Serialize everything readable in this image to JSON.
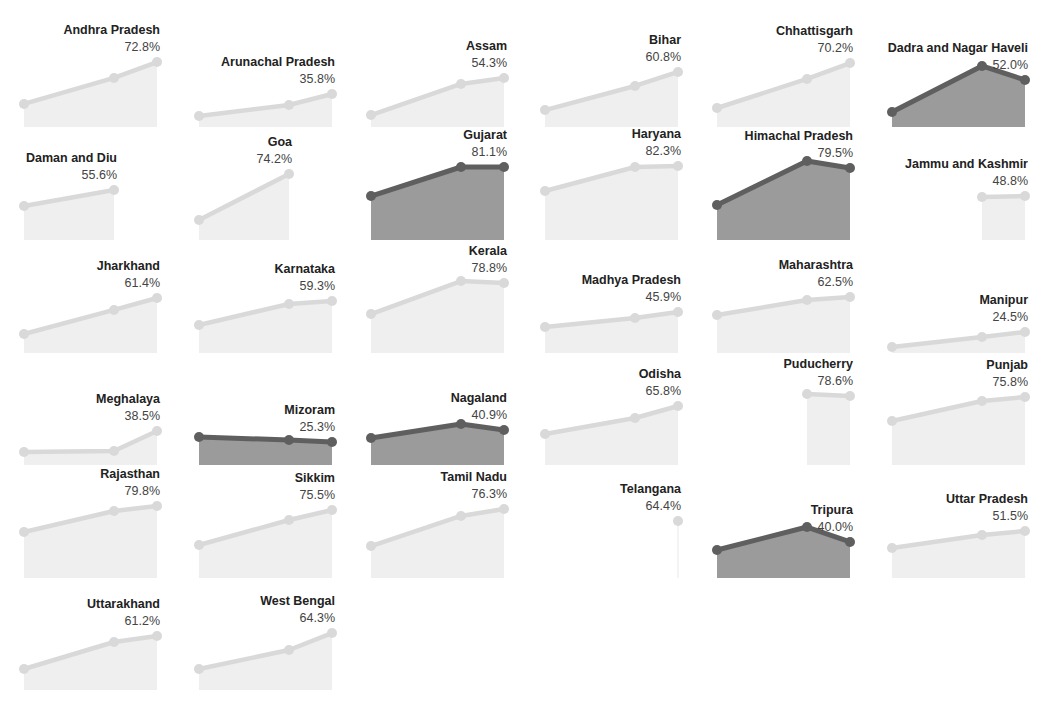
{
  "chart_data": {
    "type": "area",
    "title": "",
    "xlabel": "",
    "ylabel": "",
    "ylim": [
      0,
      100
    ],
    "grid": false,
    "legend": null,
    "layout": "small-multiples 6 columns",
    "x_slots": 3,
    "colors": {
      "muted_line": "#d9d9d9",
      "muted_fill": "#efefef",
      "highlight_line": "#5f5f5f",
      "highlight_fill": "#9b9b9b"
    },
    "panels": [
      {
        "name": "Andhra Pradesh",
        "label": "72.8%",
        "highlight": false,
        "points": [
          [
            0,
            20.4
          ],
          [
            1,
            43.4
          ],
          [
            2,
            57.5
          ]
        ]
      },
      {
        "name": "Arunachal Pradesh",
        "label": "35.8%",
        "highlight": false,
        "points": [
          [
            0,
            9.7
          ],
          [
            1,
            19.5
          ],
          [
            2,
            29.2
          ]
        ]
      },
      {
        "name": "Assam",
        "label": "54.3%",
        "highlight": false,
        "points": [
          [
            0,
            10.6
          ],
          [
            1,
            38.1
          ],
          [
            2,
            43.4
          ]
        ]
      },
      {
        "name": "Bihar",
        "label": "60.8%",
        "highlight": false,
        "points": [
          [
            0,
            15.0
          ],
          [
            1,
            36.3
          ],
          [
            2,
            48.7
          ]
        ]
      },
      {
        "name": "Chhattisgarh",
        "label": "70.2%",
        "highlight": false,
        "points": [
          [
            0,
            16.8
          ],
          [
            1,
            42.5
          ],
          [
            2,
            56.6
          ]
        ]
      },
      {
        "name": "Dadra and Nagar Haveli",
        "label": "52.0%",
        "highlight": true,
        "points": [
          [
            0,
            13.3
          ],
          [
            1,
            54.0
          ],
          [
            2,
            41.6
          ]
        ]
      },
      {
        "name": "Daman and Diu",
        "label": "55.6%",
        "highlight": false,
        "points": [
          [
            0,
            30.1
          ],
          [
            1,
            44.2
          ]
        ]
      },
      {
        "name": "Goa",
        "label": "74.2%",
        "highlight": false,
        "points": [
          [
            0,
            17.7
          ],
          [
            1,
            58.4
          ]
        ]
      },
      {
        "name": "Gujarat",
        "label": "81.1%",
        "highlight": true,
        "points": [
          [
            0,
            38.9
          ],
          [
            1,
            64.6
          ],
          [
            2,
            64.6
          ]
        ]
      },
      {
        "name": "Haryana",
        "label": "82.3%",
        "highlight": false,
        "points": [
          [
            0,
            43.4
          ],
          [
            1,
            64.6
          ],
          [
            2,
            65.5
          ]
        ]
      },
      {
        "name": "Himachal Pradesh",
        "label": "79.5%",
        "highlight": true,
        "points": [
          [
            0,
            31.0
          ],
          [
            1,
            69.9
          ],
          [
            2,
            63.7
          ]
        ]
      },
      {
        "name": "Jammu and Kashmir",
        "label": "48.8%",
        "highlight": false,
        "points": [
          [
            1,
            38.1
          ],
          [
            2,
            38.9
          ]
        ]
      },
      {
        "name": "Jharkhand",
        "label": "61.4%",
        "highlight": false,
        "points": [
          [
            0,
            16.8
          ],
          [
            1,
            38.1
          ],
          [
            2,
            48.7
          ]
        ]
      },
      {
        "name": "Karnataka",
        "label": "59.3%",
        "highlight": false,
        "points": [
          [
            0,
            24.8
          ],
          [
            1,
            43.4
          ],
          [
            2,
            46.0
          ]
        ]
      },
      {
        "name": "Kerala",
        "label": "78.8%",
        "highlight": false,
        "points": [
          [
            0,
            34.5
          ],
          [
            1,
            63.7
          ],
          [
            2,
            61.9
          ]
        ]
      },
      {
        "name": "Madhya Pradesh",
        "label": "45.9%",
        "highlight": false,
        "points": [
          [
            0,
            23.0
          ],
          [
            1,
            31.0
          ],
          [
            2,
            36.3
          ]
        ]
      },
      {
        "name": "Maharashtra",
        "label": "62.5%",
        "highlight": false,
        "points": [
          [
            0,
            33.6
          ],
          [
            1,
            46.9
          ],
          [
            2,
            49.6
          ]
        ]
      },
      {
        "name": "Manipur",
        "label": "24.5%",
        "highlight": false,
        "points": [
          [
            0,
            5.3
          ],
          [
            1,
            14.2
          ],
          [
            2,
            18.6
          ]
        ]
      },
      {
        "name": "Meghalaya",
        "label": "38.5%",
        "highlight": false,
        "points": [
          [
            0,
            11.5
          ],
          [
            1,
            12.4
          ],
          [
            2,
            30.1
          ]
        ]
      },
      {
        "name": "Mizoram",
        "label": "25.3%",
        "highlight": true,
        "points": [
          [
            0,
            24.8
          ],
          [
            1,
            22.1
          ],
          [
            2,
            20.4
          ]
        ]
      },
      {
        "name": "Nagaland",
        "label": "40.9%",
        "highlight": true,
        "points": [
          [
            0,
            23.9
          ],
          [
            1,
            36.3
          ],
          [
            2,
            31.0
          ]
        ]
      },
      {
        "name": "Odisha",
        "label": "65.8%",
        "highlight": false,
        "points": [
          [
            0,
            27.4
          ],
          [
            1,
            41.6
          ],
          [
            2,
            52.2
          ]
        ]
      },
      {
        "name": "Puducherry",
        "label": "78.6%",
        "highlight": false,
        "points": [
          [
            1,
            62.8
          ],
          [
            2,
            61.1
          ]
        ]
      },
      {
        "name": "Punjab",
        "label": "75.8%",
        "highlight": false,
        "points": [
          [
            0,
            38.9
          ],
          [
            1,
            56.6
          ],
          [
            2,
            60.2
          ]
        ]
      },
      {
        "name": "Rajasthan",
        "label": "79.8%",
        "highlight": false,
        "points": [
          [
            0,
            40.7
          ],
          [
            1,
            59.3
          ],
          [
            2,
            63.7
          ]
        ]
      },
      {
        "name": "Sikkim",
        "label": "75.5%",
        "highlight": false,
        "points": [
          [
            0,
            29.2
          ],
          [
            1,
            51.3
          ],
          [
            2,
            60.2
          ]
        ]
      },
      {
        "name": "Tamil Nadu",
        "label": "76.3%",
        "highlight": false,
        "points": [
          [
            0,
            28.3
          ],
          [
            1,
            54.9
          ],
          [
            2,
            61.1
          ]
        ]
      },
      {
        "name": "Telangana",
        "label": "64.4%",
        "highlight": false,
        "points": [
          [
            2,
            50.4
          ]
        ]
      },
      {
        "name": "Tripura",
        "label": "40.0%",
        "highlight": true,
        "points": [
          [
            0,
            24.8
          ],
          [
            1,
            45.1
          ],
          [
            2,
            31.9
          ]
        ]
      },
      {
        "name": "Uttar Pradesh",
        "label": "51.5%",
        "highlight": false,
        "points": [
          [
            0,
            26.5
          ],
          [
            1,
            38.1
          ],
          [
            2,
            41.6
          ]
        ]
      },
      {
        "name": "Uttarakhand",
        "label": "61.2%",
        "highlight": false,
        "points": [
          [
            0,
            18.6
          ],
          [
            1,
            42.5
          ],
          [
            2,
            47.8
          ]
        ]
      },
      {
        "name": "West Bengal",
        "label": "64.3%",
        "highlight": false,
        "points": [
          [
            0,
            18.6
          ],
          [
            1,
            35.4
          ],
          [
            2,
            50.4
          ]
        ]
      }
    ]
  },
  "layout": {
    "columns": 6,
    "col_x": [
      24,
      199,
      371,
      545,
      717,
      892
    ],
    "row_baseline": [
      127,
      240,
      353,
      465,
      578,
      690
    ],
    "slot_dx": [
      0,
      90,
      133
    ],
    "panel_height": 113
  }
}
